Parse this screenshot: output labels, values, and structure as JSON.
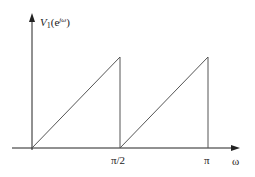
{
  "diagram": {
    "y_axis": {
      "label_main": "V",
      "label_sub": "1",
      "label_open": "(e",
      "label_sup": "jω",
      "label_close": ")"
    },
    "x_axis": {
      "label": "ω",
      "ticks": [
        {
          "label": "π/2",
          "position": "pi/2"
        },
        {
          "label": "π",
          "position": "pi"
        }
      ]
    },
    "curve": {
      "description": "Sawtooth: linear ramp from 0 to peak over [0, π/2], drops to 0, ramps again over [π/2, π], drops to 0",
      "segments": [
        {
          "from": [
            0,
            0
          ],
          "to": [
            "π/2",
            "max"
          ],
          "type": "ramp"
        },
        {
          "from": [
            "π/2",
            "max"
          ],
          "to": [
            "π/2",
            0
          ],
          "type": "drop"
        },
        {
          "from": [
            "π/2",
            0
          ],
          "to": [
            "π",
            "max"
          ],
          "type": "ramp"
        },
        {
          "from": [
            "π",
            "max"
          ],
          "to": [
            "π",
            0
          ],
          "type": "drop"
        }
      ]
    },
    "colors": {
      "axis": "#222222",
      "curve": "#555555",
      "background": "#ffffff"
    }
  }
}
